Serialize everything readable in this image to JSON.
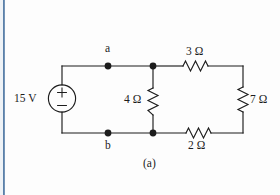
{
  "figure": {
    "caption": "(a)",
    "background_color": "#fdfdfd",
    "wire_color": "#1c1c1c",
    "edge_stripe_color": "#2d5b8e"
  },
  "source": {
    "name": "independent-voltage-source",
    "label": "15 V",
    "polarity_top": "+",
    "polarity_bottom": "−",
    "symbol": "circle"
  },
  "nodes": [
    {
      "id": "a",
      "label": "a",
      "position": "top-left-junction"
    },
    {
      "id": "b",
      "label": "b",
      "position": "bottom-left-junction"
    }
  ],
  "components": [
    {
      "id": "r3",
      "label": "3 Ω",
      "value": 3,
      "unit": "Ω",
      "orientation": "horizontal",
      "branch": "top"
    },
    {
      "id": "r4",
      "label": "4 Ω",
      "value": 4,
      "unit": "Ω",
      "orientation": "vertical",
      "branch": "middle"
    },
    {
      "id": "r2",
      "label": "2 Ω",
      "value": 2,
      "unit": "Ω",
      "orientation": "horizontal",
      "branch": "bottom"
    },
    {
      "id": "r7",
      "label": "7 Ω",
      "value": 7,
      "unit": "Ω",
      "orientation": "vertical",
      "branch": "right"
    }
  ]
}
